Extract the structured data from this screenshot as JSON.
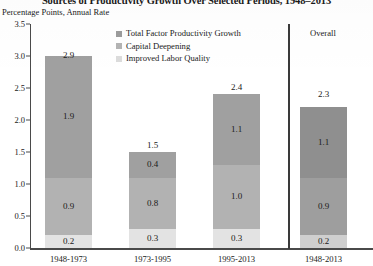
{
  "chart_data": {
    "type": "bar",
    "subtype": "stacked-column",
    "title": "Sources of Productivity Growth Over Selected Periods, 1948–2013",
    "subtitle": "Percentage Points, Annual Rate",
    "xlabel": "",
    "ylabel": "",
    "ylim": [
      0.0,
      3.5
    ],
    "ytick_labels": [
      "0.0",
      "0.5",
      "1.0",
      "1.5",
      "2.0",
      "2.5",
      "3.0",
      "3.5"
    ],
    "ytick_values": [
      0.0,
      0.5,
      1.0,
      1.5,
      2.0,
      2.5,
      3.0,
      3.5
    ],
    "grid": false,
    "legend_position": "top-center",
    "categories": [
      "1948-1973",
      "1973-1995",
      "1995-2013",
      "1948-2013"
    ],
    "series": [
      {
        "name": "Improved Labor Quality",
        "color": "#e3e3e3",
        "values": [
          0.2,
          0.3,
          0.3,
          0.2
        ]
      },
      {
        "name": "Capital Deepening",
        "color": "#b2b2b2",
        "values": [
          0.9,
          0.8,
          1.0,
          0.9
        ]
      },
      {
        "name": "Total Factor Productivity Growth",
        "color": "#a0a0a0",
        "values": [
          1.9,
          0.4,
          1.1,
          1.1
        ]
      }
    ],
    "totals": [
      2.9,
      1.5,
      2.4,
      2.3
    ],
    "annotations": {
      "overall_panel_label": "Overall",
      "overall_divider_after_category_index": 2
    }
  },
  "legend": {
    "items": [
      {
        "label": "Total Factor Productivity Growth",
        "color": "#9c9c9c",
        "swatch": "legend-swatch-tfp"
      },
      {
        "label": "Capital Deepening",
        "color": "#b4b4b4",
        "swatch": "legend-swatch-capital"
      },
      {
        "label": "Improved Labor Quality",
        "color": "#dcdcdc",
        "swatch": "legend-swatch-labor"
      }
    ]
  },
  "colors": {
    "tfp": "#a0a0a0",
    "capital": "#b2b2b2",
    "labor": "#e3e3e3",
    "axis": "#4a4a4a",
    "text": "#1a1a1a"
  }
}
